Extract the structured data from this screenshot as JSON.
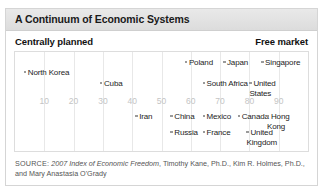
{
  "figure": {
    "title": "A Continuum of Economic Systems",
    "pole_left": "Centrally planned",
    "pole_right": "Free market"
  },
  "source": {
    "label": "SOURCE:",
    "title": "2007 Index of Economic Freedom",
    "rest": ", Timothy Kane, Ph.D., Kim R. Holmes, Ph.D., and Mary Anastasia O'Grady"
  },
  "chart_data": {
    "type": "scatter",
    "title": "A Continuum of Economic Systems",
    "xlabel": "",
    "ylabel": "",
    "xlim": [
      0,
      100
    ],
    "grid": true,
    "legend": "none",
    "axis_poles": {
      "left": "Centrally planned",
      "right": "Free market"
    },
    "ticks": [
      10,
      20,
      30,
      40,
      50,
      60,
      70,
      80,
      90
    ],
    "tick_labels": [
      "10",
      "20",
      "30",
      "40",
      "50",
      "60",
      "70",
      "80",
      "90"
    ],
    "marker_color": "#9a9a9a",
    "categories": [
      "North Korea",
      "Cuba",
      "Poland",
      "Japan",
      "Singapore",
      "South Africa",
      "United States",
      "Iran",
      "China",
      "Mexico",
      "Canada",
      "Hong Kong",
      "Russia",
      "France",
      "United Kingdom"
    ],
    "values": [
      3,
      29,
      58,
      71,
      84,
      64,
      80,
      41,
      53,
      64,
      76,
      86,
      53,
      64,
      79
    ],
    "points": [
      {
        "label": "North Korea",
        "x": 3,
        "row": 2,
        "wrap": false
      },
      {
        "label": "Cuba",
        "x": 29,
        "row": 3,
        "wrap": false
      },
      {
        "label": "Poland",
        "x": 58,
        "row": 1,
        "wrap": false
      },
      {
        "label": "Japan",
        "x": 71,
        "row": 1,
        "wrap": false
      },
      {
        "label": "Singapore",
        "x": 84,
        "row": 1,
        "wrap": false
      },
      {
        "label": "South Africa",
        "x": 64,
        "row": 3,
        "wrap": false
      },
      {
        "label": "United States",
        "x": 80,
        "row": 3,
        "wrap": true
      },
      {
        "label": "Iran",
        "x": 41,
        "row": 5,
        "wrap": false
      },
      {
        "label": "China",
        "x": 53,
        "row": 5,
        "wrap": false
      },
      {
        "label": "Mexico",
        "x": 64,
        "row": 5,
        "wrap": false
      },
      {
        "label": "Canada",
        "x": 76,
        "row": 5,
        "wrap": false
      },
      {
        "label": "Hong Kong",
        "x": 86,
        "row": 5,
        "wrap": true
      },
      {
        "label": "Russia",
        "x": 53,
        "row": 6,
        "wrap": false
      },
      {
        "label": "France",
        "x": 64,
        "row": 6,
        "wrap": false
      },
      {
        "label": "United Kingdom",
        "x": 79,
        "row": 6,
        "wrap": true
      }
    ]
  }
}
